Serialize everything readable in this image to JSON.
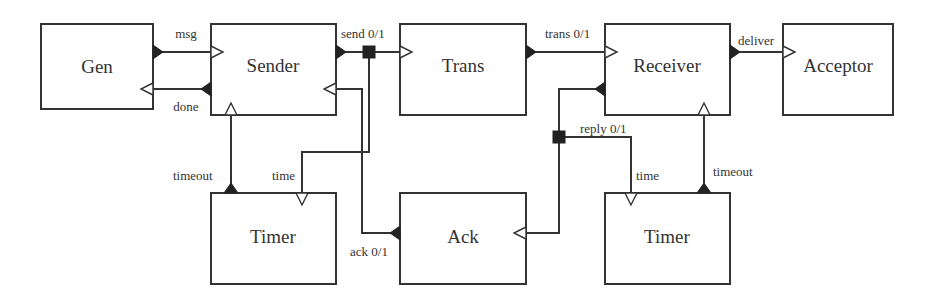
{
  "diagram": {
    "type": "block-diagram",
    "components": [
      {
        "id": "gen",
        "label": "Gen"
      },
      {
        "id": "sender",
        "label": "Sender"
      },
      {
        "id": "trans",
        "label": "Trans"
      },
      {
        "id": "receiver",
        "label": "Receiver"
      },
      {
        "id": "acceptor",
        "label": "Acceptor"
      },
      {
        "id": "timer_sender",
        "label": "Timer"
      },
      {
        "id": "ack",
        "label": "Ack"
      },
      {
        "id": "timer_receiver",
        "label": "Timer"
      }
    ],
    "connections": [
      {
        "id": "msg",
        "label": "msg",
        "from": "gen",
        "to": "sender"
      },
      {
        "id": "done",
        "label": "done",
        "from": "sender",
        "to": "gen"
      },
      {
        "id": "send",
        "label": "send 0/1",
        "from": "sender",
        "to": [
          "trans",
          "timer_sender"
        ]
      },
      {
        "id": "trans",
        "label": "trans 0/1",
        "from": "trans",
        "to": "receiver"
      },
      {
        "id": "deliver",
        "label": "deliver",
        "from": "receiver",
        "to": "acceptor"
      },
      {
        "id": "timeout_sender",
        "label": "timeout",
        "from": "timer_sender",
        "to": "sender"
      },
      {
        "id": "time_sender",
        "label": "time",
        "from": "sender",
        "to": "timer_sender"
      },
      {
        "id": "ack",
        "label": "ack 0/1",
        "from": "ack",
        "to": "sender"
      },
      {
        "id": "reply",
        "label": "reply 0/1",
        "from": "receiver",
        "to": [
          "ack",
          "timer_receiver"
        ]
      },
      {
        "id": "time_receiver",
        "label": "time",
        "from": "receiver",
        "to": "timer_receiver"
      },
      {
        "id": "timeout_receiver",
        "label": "timeout",
        "from": "timer_receiver",
        "to": "receiver"
      }
    ]
  },
  "labels": {
    "gen": "Gen",
    "sender": "Sender",
    "trans": "Trans",
    "receiver": "Receiver",
    "acceptor": "Acceptor",
    "timer_left": "Timer",
    "ack": "Ack",
    "timer_right": "Timer",
    "msg": "msg",
    "done": "done",
    "send": "send 0/1",
    "trans_wire": "trans 0/1",
    "deliver": "deliver",
    "timeout_left": "timeout",
    "time_left": "time",
    "ack_wire": "ack 0/1",
    "reply": "reply 0/1",
    "time_right": "time",
    "timeout_right": "timeout"
  },
  "colors": {
    "stroke": "#333333",
    "port_fill": "#222222",
    "background": "#ffffff"
  }
}
